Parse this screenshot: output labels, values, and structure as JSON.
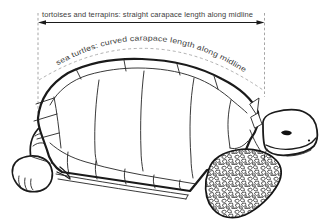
{
  "labels": {
    "straight": "tortoises and terrapins: straight carapace length along midline",
    "curved": "sea turtles: curved carapace length along midline"
  },
  "colors": {
    "background": "#ffffff",
    "ink": "#1a1a1a",
    "dashed_guides": "#9b9b9b",
    "label_text": "#3d3d3d"
  }
}
